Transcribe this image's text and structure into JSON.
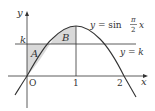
{
  "diagram": {
    "curve_label": {
      "prefix": "y = sin",
      "frac_num": "π",
      "frac_den": "2",
      "var": "x"
    },
    "line_label": "y = k",
    "axis_labels": {
      "x": "x",
      "y": "y"
    },
    "ticks": {
      "origin": "O",
      "x1": "1",
      "x2": "2"
    },
    "k_label": "k",
    "regions": {
      "A": "A",
      "B": "B"
    },
    "colors": {
      "shade": "#d9d9d9",
      "stroke": "#333333"
    }
  }
}
